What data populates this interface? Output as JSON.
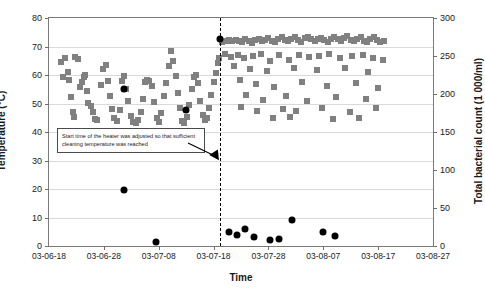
{
  "chart_data": {
    "type": "scatter",
    "title": "",
    "xlabel": "Time",
    "ylabel": "Temperature (°C)",
    "y2label": "Total bacterial count (1 000/ml)",
    "grid": true,
    "legend": "none",
    "xlim": [
      0,
      70
    ],
    "xtick_labels": [
      "03-06-18",
      "03-06-28",
      "03-07-08",
      "03-07-18",
      "03-07-28",
      "03-08-07",
      "03-08-17",
      "03-08-27"
    ],
    "xtick_values": [
      0,
      10,
      20,
      30,
      40,
      50,
      60,
      70
    ],
    "ylim": [
      0,
      80
    ],
    "ytick_values": [
      0,
      10,
      20,
      30,
      40,
      50,
      60,
      70,
      80
    ],
    "y2lim": [
      0,
      300
    ],
    "y2tick_values": [
      0,
      50,
      100,
      150,
      200,
      250,
      300
    ],
    "annotations": [
      {
        "name": "heater-note",
        "text": "Start time of the heater was adjusted so that sufficient cleaning temperature was reached",
        "points_to_x": 31.2,
        "points_to_y": 34
      },
      {
        "name": "event-line",
        "type": "vline",
        "x": 31.2,
        "style": "dashed",
        "color": "#000000"
      }
    ],
    "series": [
      {
        "name": "Temperature",
        "marker": "square",
        "color": "#808080",
        "axis": "left",
        "points": [
          [
            2.1,
            64.4
          ],
          [
            3.0,
            66.0
          ],
          [
            3.4,
            61.1
          ],
          [
            4.7,
            66.3
          ],
          [
            5.2,
            65.6
          ],
          [
            2.6,
            59.4
          ],
          [
            3.6,
            58.2
          ],
          [
            4.0,
            52.3
          ],
          [
            4.3,
            47.0
          ],
          [
            4.5,
            45.2
          ],
          [
            5.6,
            55.8
          ],
          [
            6.0,
            57.5
          ],
          [
            6.3,
            59.2
          ],
          [
            6.5,
            60.1
          ],
          [
            6.9,
            54.4
          ],
          [
            7.2,
            50.1
          ],
          [
            7.6,
            49.2
          ],
          [
            8.0,
            46.9
          ],
          [
            8.3,
            44.6
          ],
          [
            8.8,
            44.1
          ],
          [
            9.4,
            56.6
          ],
          [
            9.8,
            62.1
          ],
          [
            10.3,
            63.6
          ],
          [
            10.7,
            57.8
          ],
          [
            11.1,
            52.6
          ],
          [
            11.5,
            47.9
          ],
          [
            11.9,
            44.8
          ],
          [
            12.4,
            43.9
          ],
          [
            12.9,
            47.8
          ],
          [
            13.3,
            58.0
          ],
          [
            13.7,
            59.5
          ],
          [
            14.0,
            55.1
          ],
          [
            14.4,
            50.9
          ],
          [
            14.9,
            45.6
          ],
          [
            15.4,
            43.5
          ],
          [
            15.8,
            43.2
          ],
          [
            16.3,
            44.3
          ],
          [
            16.8,
            47.1
          ],
          [
            17.2,
            51.6
          ],
          [
            17.5,
            57.6
          ],
          [
            17.9,
            58.2
          ],
          [
            18.3,
            58.0
          ],
          [
            18.7,
            56.1
          ],
          [
            19.1,
            50.4
          ],
          [
            19.6,
            44.9
          ],
          [
            20.1,
            43.6
          ],
          [
            20.5,
            46.8
          ],
          [
            21.0,
            52.6
          ],
          [
            21.4,
            57.3
          ],
          [
            21.8,
            63.0
          ],
          [
            22.2,
            68.4
          ],
          [
            22.6,
            64.9
          ],
          [
            23.1,
            59.5
          ],
          [
            23.5,
            53.8
          ],
          [
            23.9,
            48.3
          ],
          [
            24.3,
            44.0
          ],
          [
            24.7,
            43.3
          ],
          [
            25.1,
            45.1
          ],
          [
            25.6,
            49.6
          ],
          [
            26.0,
            55.0
          ],
          [
            26.4,
            59.3
          ],
          [
            26.8,
            60.0
          ],
          [
            27.2,
            57.2
          ],
          [
            27.6,
            51.0
          ],
          [
            28.0,
            46.0
          ],
          [
            28.4,
            44.2
          ],
          [
            28.8,
            45.0
          ],
          [
            29.2,
            48.5
          ],
          [
            29.6,
            53.0
          ],
          [
            30.0,
            57.4
          ],
          [
            30.4,
            60.6
          ],
          [
            30.8,
            64.2
          ],
          [
            31.0,
            66.1
          ],
          [
            31.6,
            71.5
          ],
          [
            32.2,
            72.0
          ],
          [
            32.8,
            72.3
          ],
          [
            33.4,
            71.8
          ],
          [
            34.0,
            72.4
          ],
          [
            34.6,
            72.1
          ],
          [
            35.2,
            71.6
          ],
          [
            35.8,
            72.5
          ],
          [
            36.4,
            72.0
          ],
          [
            37.0,
            71.4
          ],
          [
            37.6,
            72.2
          ],
          [
            38.2,
            72.6
          ],
          [
            38.8,
            71.9
          ],
          [
            39.4,
            72.3
          ],
          [
            40.0,
            73.0
          ],
          [
            40.6,
            72.1
          ],
          [
            41.2,
            71.5
          ],
          [
            41.8,
            72.8
          ],
          [
            42.4,
            73.2
          ],
          [
            43.0,
            72.2
          ],
          [
            43.6,
            71.8
          ],
          [
            44.2,
            72.6
          ],
          [
            44.8,
            73.4
          ],
          [
            45.4,
            72.4
          ],
          [
            46.0,
            71.7
          ],
          [
            46.6,
            72.9
          ],
          [
            47.2,
            73.5
          ],
          [
            47.8,
            72.6
          ],
          [
            48.4,
            71.9
          ],
          [
            49.0,
            72.8
          ],
          [
            49.6,
            73.1
          ],
          [
            50.2,
            72.3
          ],
          [
            50.8,
            71.6
          ],
          [
            51.4,
            72.7
          ],
          [
            52.0,
            73.3
          ],
          [
            52.6,
            72.5
          ],
          [
            53.2,
            71.8
          ],
          [
            53.8,
            72.9
          ],
          [
            54.4,
            73.6
          ],
          [
            55.0,
            72.4
          ],
          [
            55.6,
            71.9
          ],
          [
            56.2,
            72.8
          ],
          [
            56.8,
            73.2
          ],
          [
            57.4,
            72.1
          ],
          [
            58.0,
            71.5
          ],
          [
            58.6,
            72.6
          ],
          [
            59.2,
            73.4
          ],
          [
            59.8,
            72.2
          ],
          [
            60.4,
            71.6
          ],
          [
            61.0,
            72.0
          ],
          [
            32.0,
            67.5
          ],
          [
            33.2,
            66.4
          ],
          [
            34.4,
            67.0
          ],
          [
            35.6,
            65.8
          ],
          [
            37.2,
            66.8
          ],
          [
            38.6,
            67.3
          ],
          [
            40.2,
            64.9
          ],
          [
            42.0,
            66.9
          ],
          [
            43.8,
            65.2
          ],
          [
            45.6,
            67.1
          ],
          [
            47.4,
            66.3
          ],
          [
            49.2,
            66.5
          ],
          [
            51.0,
            67.2
          ],
          [
            53.0,
            65.9
          ],
          [
            55.2,
            66.7
          ],
          [
            57.2,
            67.0
          ],
          [
            59.0,
            66.1
          ],
          [
            60.8,
            65.4
          ],
          [
            33.8,
            63.0
          ],
          [
            36.6,
            62.2
          ],
          [
            39.8,
            61.5
          ],
          [
            44.6,
            62.6
          ],
          [
            48.8,
            61.8
          ],
          [
            54.0,
            62.3
          ],
          [
            58.2,
            61.2
          ],
          [
            34.8,
            58.2
          ],
          [
            37.8,
            57.0
          ],
          [
            41.0,
            55.9
          ],
          [
            46.2,
            57.6
          ],
          [
            50.6,
            56.1
          ],
          [
            56.0,
            57.3
          ],
          [
            60.0,
            55.6
          ],
          [
            36.0,
            53.0
          ],
          [
            39.0,
            51.4
          ],
          [
            43.2,
            52.6
          ],
          [
            47.0,
            51.0
          ],
          [
            52.4,
            52.2
          ],
          [
            57.8,
            51.5
          ],
          [
            35.0,
            48.6
          ],
          [
            38.0,
            47.2
          ],
          [
            42.6,
            48.0
          ],
          [
            45.0,
            47.4
          ],
          [
            49.8,
            48.3
          ],
          [
            54.8,
            47.1
          ],
          [
            59.6,
            48.5
          ],
          [
            40.8,
            44.8
          ],
          [
            44.0,
            45.2
          ],
          [
            51.8,
            44.6
          ],
          [
            56.6,
            45.0
          ]
        ]
      },
      {
        "name": "Total bacterial count",
        "marker": "circle",
        "color": "#000000",
        "axis": "right",
        "points": [
          [
            13.6,
            74
          ],
          [
            19.5,
            5
          ],
          [
            31.2,
            272
          ],
          [
            32.8,
            18
          ],
          [
            34.3,
            15
          ],
          [
            35.8,
            22
          ],
          [
            37.3,
            12
          ],
          [
            40.2,
            8
          ],
          [
            42.0,
            9
          ],
          [
            44.3,
            34
          ],
          [
            50.0,
            18
          ],
          [
            52.2,
            13
          ]
        ],
        "points_left_axis": [
          [
            13.6,
            55.0
          ],
          [
            24.9,
            47.8
          ]
        ]
      }
    ]
  }
}
